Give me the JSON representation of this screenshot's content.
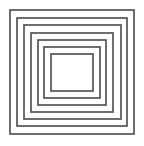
{
  "diagram": {
    "type": "concentric-squares",
    "width": 144,
    "height": 146,
    "background": "#ffffff",
    "stroke_color": "#4a4a4a",
    "stroke_width": 1.6,
    "squares": [
      {
        "left": 10,
        "top": 10,
        "right": 134,
        "bottom": 134
      },
      {
        "left": 17,
        "top": 18,
        "right": 127,
        "bottom": 126
      },
      {
        "left": 24,
        "top": 25,
        "right": 121,
        "bottom": 119
      },
      {
        "left": 31,
        "top": 33,
        "right": 113,
        "bottom": 112
      },
      {
        "left": 38,
        "top": 40,
        "right": 106,
        "bottom": 105
      },
      {
        "left": 44,
        "top": 47,
        "right": 100,
        "bottom": 98
      },
      {
        "left": 51,
        "top": 54,
        "right": 93,
        "bottom": 91
      }
    ]
  }
}
